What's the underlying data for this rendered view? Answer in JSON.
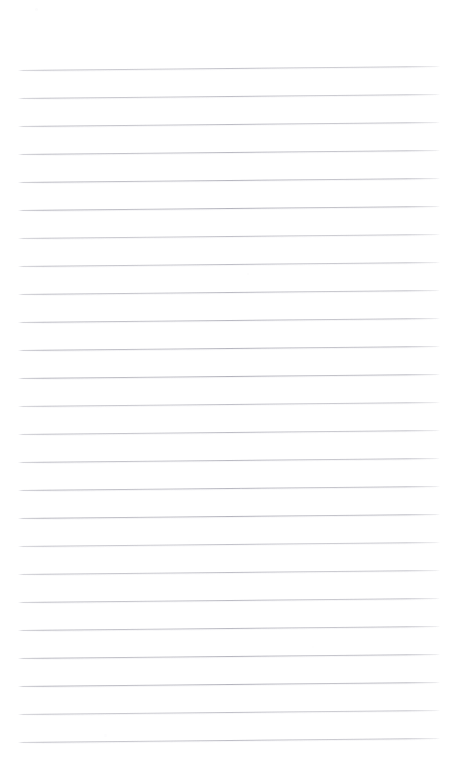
{
  "document": {
    "kind": "scanned-blank-ruled-page",
    "title": "Blank Ruled Notebook Page",
    "text_content": "",
    "handwriting_present": "no",
    "printed_text_present": "no",
    "page_number_visible": "no"
  },
  "canvas": {
    "width": 458,
    "height": 777,
    "background_color": "#ffffff",
    "paper_tone_color": "#fdfdfe"
  },
  "ruling": {
    "style": "horizontal-ruled",
    "line_color": "#b4b4bc",
    "line_thickness_px": 1,
    "line_count": 25,
    "line_spacing_px": 28,
    "first_line_y": 70,
    "last_line_y": 742,
    "line_start_x": 18,
    "line_end_x": 440,
    "line_length_px": 422,
    "skew_rise_px": 4,
    "skew_direction": "rises-left-to-right",
    "margins": {
      "top_px": 70,
      "bottom_px": 35,
      "left_px": 18,
      "right_px": 18
    },
    "line_positions_y": [
      70,
      98,
      126,
      154,
      182,
      210,
      238,
      266,
      294,
      322,
      350,
      378,
      406,
      434,
      462,
      490,
      518,
      546,
      574,
      602,
      630,
      658,
      686,
      714,
      742
    ]
  },
  "artifacts": {
    "description": "faint scanner speckle",
    "specks": [
      {
        "x": 35,
        "y": 8,
        "size": 3,
        "opacity": 0.55
      },
      {
        "x": 247,
        "y": 273,
        "size": 2,
        "opacity": 0.4
      },
      {
        "x": 240,
        "y": 487,
        "size": 2,
        "opacity": 0.35
      },
      {
        "x": 188,
        "y": 540,
        "size": 2,
        "opacity": 0.3
      },
      {
        "x": 104,
        "y": 734,
        "size": 2.5,
        "opacity": 0.35
      },
      {
        "x": 432,
        "y": 487,
        "size": 2,
        "opacity": 0.3
      },
      {
        "x": 312,
        "y": 646,
        "size": 2,
        "opacity": 0.28
      }
    ]
  }
}
